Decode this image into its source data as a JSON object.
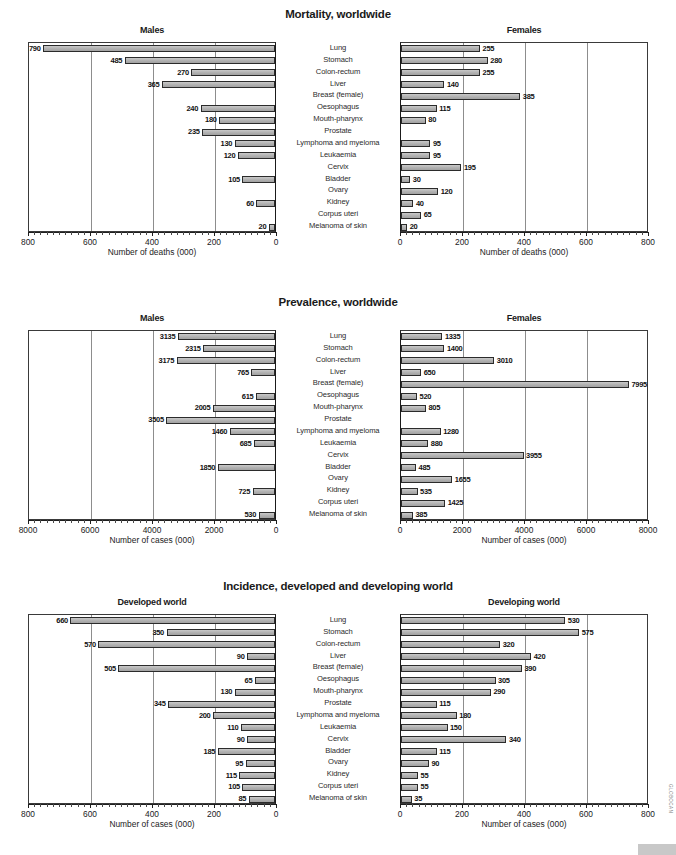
{
  "figure": {
    "corner_code": "GLOBOCAN",
    "categories": [
      "Lung",
      "Stomach",
      "Colon-rectum",
      "Liver",
      "Breast (female)",
      "Oesophagus",
      "Mouth-pharynx",
      "Prostate",
      "Lymphoma and myeloma",
      "Leukaemia",
      "Cervix",
      "Bladder",
      "Ovary",
      "Kidney",
      "Corpus uteri",
      "Melanoma of skin"
    ]
  },
  "chart_data": [
    {
      "type": "bar",
      "title": "Mortality, worldwide",
      "orientation": "horizontal-mirrored",
      "categories": [
        "Lung",
        "Stomach",
        "Colon-rectum",
        "Liver",
        "Breast (female)",
        "Oesophagus",
        "Mouth-pharynx",
        "Prostate",
        "Lymphoma and myeloma",
        "Leukaemia",
        "Cervix",
        "Bladder",
        "Ovary",
        "Kidney",
        "Corpus uteri",
        "Melanoma of skin"
      ],
      "left": {
        "label": "Males",
        "xlabel": "Number of deaths (000)",
        "xlim": [
          0,
          800
        ],
        "ticks": [
          800,
          600,
          400,
          200,
          0
        ],
        "values": [
          790,
          485,
          270,
          365,
          null,
          240,
          180,
          235,
          130,
          120,
          null,
          105,
          null,
          60,
          null,
          20
        ]
      },
      "right": {
        "label": "Females",
        "xlabel": "Number of deaths (000)",
        "xlim": [
          0,
          800
        ],
        "ticks": [
          0,
          200,
          400,
          600,
          800
        ],
        "values": [
          255,
          280,
          255,
          140,
          385,
          115,
          80,
          null,
          95,
          95,
          195,
          30,
          120,
          40,
          65,
          20
        ]
      },
      "grid": true,
      "legend": "none"
    },
    {
      "type": "bar",
      "title": "Prevalence, worldwide",
      "orientation": "horizontal-mirrored",
      "categories": [
        "Lung",
        "Stomach",
        "Colon-rectum",
        "Liver",
        "Breast (female)",
        "Oesophagus",
        "Mouth-pharynx",
        "Prostate",
        "Lymphoma and myeloma",
        "Leukaemia",
        "Cervix",
        "Bladder",
        "Ovary",
        "Kidney",
        "Corpus uteri",
        "Melanoma of skin"
      ],
      "left": {
        "label": "Males",
        "xlabel": "Number of cases (000)",
        "xlim": [
          0,
          8000
        ],
        "ticks": [
          8000,
          6000,
          4000,
          2000,
          0
        ],
        "values": [
          3135,
          2315,
          3175,
          765,
          null,
          615,
          2005,
          3505,
          1460,
          685,
          null,
          1850,
          null,
          725,
          null,
          530
        ]
      },
      "right": {
        "label": "Females",
        "xlabel": "Number of cases (000)",
        "xlim": [
          0,
          8000
        ],
        "ticks": [
          0,
          2000,
          4000,
          6000,
          8000
        ],
        "values": [
          1335,
          1400,
          3010,
          650,
          7995,
          520,
          805,
          null,
          1280,
          880,
          3955,
          485,
          1655,
          535,
          1425,
          385
        ]
      },
      "grid": true,
      "legend": "none"
    },
    {
      "type": "bar",
      "title": "Incidence, developed and developing world",
      "orientation": "horizontal-mirrored",
      "categories": [
        "Lung",
        "Stomach",
        "Colon-rectum",
        "Liver",
        "Breast (female)",
        "Oesophagus",
        "Mouth-pharynx",
        "Prostate",
        "Lymphoma and myeloma",
        "Leukaemia",
        "Cervix",
        "Bladder",
        "Ovary",
        "Kidney",
        "Corpus uteri",
        "Melanoma of skin"
      ],
      "left": {
        "label": "Developed world",
        "xlabel": "Number of cases (000)",
        "xlim": [
          0,
          800
        ],
        "ticks": [
          800,
          600,
          400,
          200,
          0
        ],
        "values": [
          660,
          350,
          570,
          90,
          505,
          65,
          130,
          345,
          200,
          110,
          90,
          185,
          95,
          115,
          105,
          85
        ]
      },
      "right": {
        "label": "Developing world",
        "xlabel": "Number of cases (000)",
        "xlim": [
          0,
          800
        ],
        "ticks": [
          0,
          200,
          400,
          600,
          800
        ],
        "values": [
          530,
          575,
          320,
          420,
          390,
          305,
          290,
          115,
          180,
          150,
          340,
          115,
          90,
          55,
          55,
          35
        ]
      },
      "grid": true,
      "legend": "none"
    }
  ]
}
